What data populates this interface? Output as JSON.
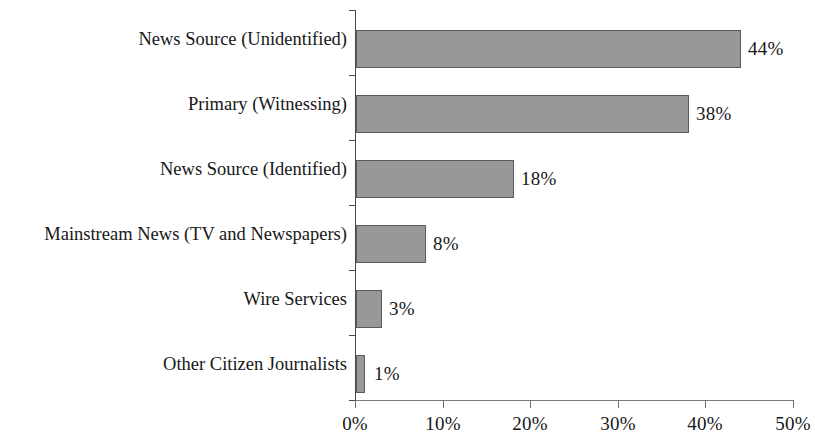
{
  "chart_data": {
    "type": "bar",
    "orientation": "horizontal",
    "title": "",
    "xlabel": "",
    "ylabel": "",
    "categories": [
      "News Source (Unidentified)",
      "Primary (Witnessing)",
      "News Source (Identified)",
      "Mainstream News (TV and Newspapers)",
      "Wire Services",
      "Other Citizen Journalists"
    ],
    "values": [
      44,
      38,
      18,
      8,
      3,
      1
    ],
    "value_labels": [
      "44%",
      "38%",
      "18%",
      "8%",
      "3%",
      "1%"
    ],
    "xlim": [
      0,
      50
    ],
    "xticks": [
      0,
      10,
      20,
      30,
      40,
      50
    ],
    "xtick_labels": [
      "0%",
      "10%",
      "20%",
      "30%",
      "40%",
      "50%"
    ],
    "grid": false,
    "legend": null,
    "bar_color": "#989898",
    "bar_border_color": "#5a5a5a",
    "axis_color": "#4a4a4a",
    "text_color": "#171717"
  }
}
